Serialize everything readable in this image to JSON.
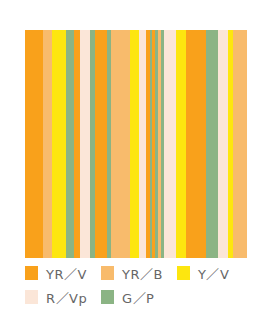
{
  "palette": {
    "YR/V": "#f9a11b",
    "YR/B": "#f8bb6c",
    "Y/V": "#fde60f",
    "R/Vp": "#fbe6d8",
    "G/P": "#8bb484"
  },
  "stripes": [
    {
      "key": "YR/V",
      "width": 18
    },
    {
      "key": "YR/B",
      "width": 9
    },
    {
      "key": "Y/V",
      "width": 14
    },
    {
      "key": "G/P",
      "width": 8
    },
    {
      "key": "YR/V",
      "width": 6
    },
    {
      "key": "R/Vp",
      "width": 10
    },
    {
      "key": "G/P",
      "width": 5
    },
    {
      "key": "YR/V",
      "width": 12
    },
    {
      "key": "G/P",
      "width": 4
    },
    {
      "key": "YR/B",
      "width": 19
    },
    {
      "key": "Y/V",
      "width": 9
    },
    {
      "key": "R/Vp",
      "width": 7
    },
    {
      "key": "YR/V",
      "width": 4
    },
    {
      "key": "G/P",
      "width": 2
    },
    {
      "key": "YR/V",
      "width": 3
    },
    {
      "key": "G/P",
      "width": 3
    },
    {
      "key": "YR/B",
      "width": 3
    },
    {
      "key": "G/P",
      "width": 3
    },
    {
      "key": "R/Vp",
      "width": 12
    },
    {
      "key": "Y/V",
      "width": 10
    },
    {
      "key": "YR/V",
      "width": 20
    },
    {
      "key": "G/P",
      "width": 12
    },
    {
      "key": "R/Vp",
      "width": 10
    },
    {
      "key": "Y/V",
      "width": 5
    },
    {
      "key": "YR/B",
      "width": 14
    }
  ],
  "legend": [
    {
      "key": "YR/V",
      "label": "YR／V",
      "color": "#f9a11b"
    },
    {
      "key": "YR/B",
      "label": "YR／B",
      "color": "#f8bb6c"
    },
    {
      "key": "Y/V",
      "label": "Y／V",
      "color": "#fde60f"
    },
    {
      "key": "R/Vp",
      "label": "R／Vp",
      "color": "#fbe6d8"
    },
    {
      "key": "G/P",
      "label": "G／P",
      "color": "#8bb484"
    }
  ]
}
